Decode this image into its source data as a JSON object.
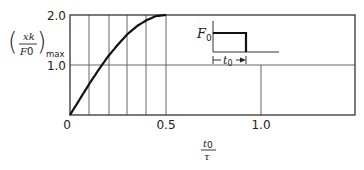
{
  "chart_data": {
    "type": "line",
    "title": "",
    "xlabel": "t0/τ",
    "ylabel": "(xk/F0)max",
    "xlim": [
      0,
      1.5
    ],
    "ylim": [
      0,
      2.0
    ],
    "x_ticks": [
      "0",
      "0.5",
      "1.0"
    ],
    "y_ticks": [
      "0",
      "1.0",
      "2.0"
    ],
    "grid": {
      "vertical_at": [
        0.1,
        0.2,
        0.3,
        0.4,
        0.5,
        1.0
      ],
      "horizontal_at": [
        1.0
      ]
    },
    "series": [
      {
        "name": "shock spectrum (rectangular pulse)",
        "x": [
          0,
          0.05,
          0.1,
          0.15,
          0.2,
          0.25,
          0.3,
          0.35,
          0.4,
          0.45,
          0.5
        ],
        "y": [
          0,
          0.31,
          0.62,
          0.91,
          1.18,
          1.41,
          1.62,
          1.78,
          1.9,
          1.98,
          2.0
        ]
      }
    ],
    "inset": {
      "description": "rectangular force pulse of amplitude F0 and duration t0",
      "amplitude_label": "F0",
      "duration_label": "t0"
    },
    "legend": null
  },
  "labels": {
    "y_tick_0": "0",
    "y_tick_1": "1.0",
    "y_tick_2": "2.0",
    "x_tick_0": "0",
    "x_tick_05": "0.5",
    "x_tick_1": "1.0",
    "ylabel_num": "xk",
    "ylabel_den": "F",
    "ylabel_den_sub": "0",
    "ylabel_sub": "max",
    "xlabel_num": "t",
    "xlabel_num_sub": "0",
    "xlabel_den": "τ",
    "inset_F": "F",
    "inset_F_sub": "0",
    "inset_t": "t",
    "inset_t_sub": "0"
  }
}
